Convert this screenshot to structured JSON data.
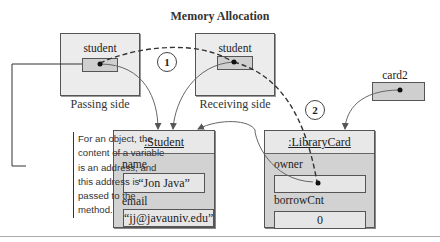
{
  "title": "Memory Allocation",
  "passing_side": {
    "variable": "student",
    "caption": "Passing side"
  },
  "receiving_side": {
    "variable": "student",
    "caption": "Receiving side"
  },
  "card2": {
    "variable": "card2"
  },
  "student_object": {
    "header": ":Student",
    "fields": [
      {
        "label": "name",
        "value": "“Jon Java”"
      },
      {
        "label": "email",
        "value": "“jj@javauniv.edu”"
      }
    ]
  },
  "librarycard_object": {
    "header": ":LibraryCard",
    "fields": [
      {
        "label": "owner",
        "value": ""
      },
      {
        "label": "borrowCnt",
        "value": "0"
      }
    ]
  },
  "steps": [
    "1",
    "2"
  ],
  "note": "For an object, the content of a variable is an address, and this address is passed to the method.",
  "colors": {
    "frame_bg": "#ececec",
    "cell_bg": "#cfcfcf",
    "object_bg": "#d2d2d2",
    "line": "#555555"
  }
}
